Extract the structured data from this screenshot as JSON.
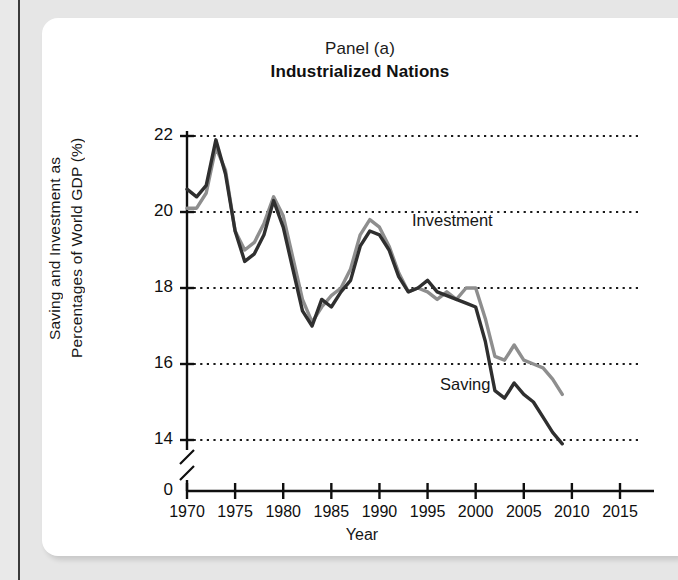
{
  "figure": {
    "panel_label": "Panel (a)",
    "panel_title": "Industrialized Nations",
    "xlabel": "Year",
    "ylabel_line_1": "Saving and Investment as",
    "ylabel_line_2": "Percentages of World GDP (%)"
  },
  "annotations": {
    "investment": "Investment",
    "saving": "Saving"
  },
  "axis": {
    "y_ticks": [
      "22",
      "20",
      "18",
      "16",
      "14",
      "0"
    ],
    "x_ticks": [
      "1970",
      "1975",
      "1980",
      "1985",
      "1990",
      "1995",
      "2000",
      "2005",
      "2010",
      "2015"
    ]
  },
  "colors": {
    "saving_line": "#2f2f2f",
    "investment_line": "#8e8e8e",
    "axis": "#0f0f0f",
    "gridline": "#1a1a1a",
    "card_background": "#ffffff",
    "page_background": "#e6e6e6"
  },
  "chart_data": {
    "type": "line",
    "subtitle": "Industrialized Nations",
    "xlabel": "Year",
    "ylabel": "Saving and Investment as Percentages of World GDP (%)",
    "xlim": [
      1970,
      2015
    ],
    "ylim": [
      13.0,
      22.0
    ],
    "y_axis_break": true,
    "y_axis_break_between": [
      0,
      13.0
    ],
    "y_ticks": [
      22,
      20,
      18,
      16,
      14,
      0
    ],
    "x_ticks": [
      1970,
      1975,
      1980,
      1985,
      1990,
      1995,
      2000,
      2005,
      2010,
      2015
    ],
    "grid": "horizontal-dotted",
    "legend": "inline-annotations",
    "x": [
      1970,
      1971,
      1972,
      1973,
      1974,
      1975,
      1976,
      1977,
      1978,
      1979,
      1980,
      1981,
      1982,
      1983,
      1984,
      1985,
      1986,
      1987,
      1988,
      1989,
      1990,
      1991,
      1992,
      1993,
      1994,
      1995,
      1996,
      1997,
      1998,
      1999,
      2000,
      2001,
      2002,
      2003,
      2004,
      2005,
      2006,
      2007,
      2008,
      2009
    ],
    "series": [
      {
        "name": "Saving",
        "color": "#2f2f2f",
        "values": [
          20.6,
          20.4,
          20.7,
          21.9,
          21.0,
          19.5,
          18.7,
          18.9,
          19.4,
          20.3,
          19.6,
          18.5,
          17.4,
          17.0,
          17.7,
          17.5,
          17.9,
          18.2,
          19.1,
          19.5,
          19.4,
          19.0,
          18.3,
          17.9,
          18.0,
          18.2,
          17.9,
          17.8,
          17.7,
          17.6,
          17.5,
          16.6,
          15.3,
          15.1,
          15.5,
          15.2,
          15.0,
          14.6,
          14.2,
          13.9
        ]
      },
      {
        "name": "Investment",
        "color": "#8e8e8e",
        "values": [
          20.1,
          20.1,
          20.5,
          21.7,
          21.1,
          19.5,
          19.0,
          19.2,
          19.7,
          20.4,
          19.9,
          18.8,
          17.7,
          17.1,
          17.5,
          17.8,
          18.0,
          18.5,
          19.4,
          19.8,
          19.6,
          19.1,
          18.4,
          17.9,
          18.0,
          17.9,
          17.7,
          17.9,
          17.7,
          18.0,
          18.0,
          17.2,
          16.2,
          16.1,
          16.5,
          16.1,
          16.0,
          15.9,
          15.6,
          15.2
        ]
      }
    ]
  }
}
